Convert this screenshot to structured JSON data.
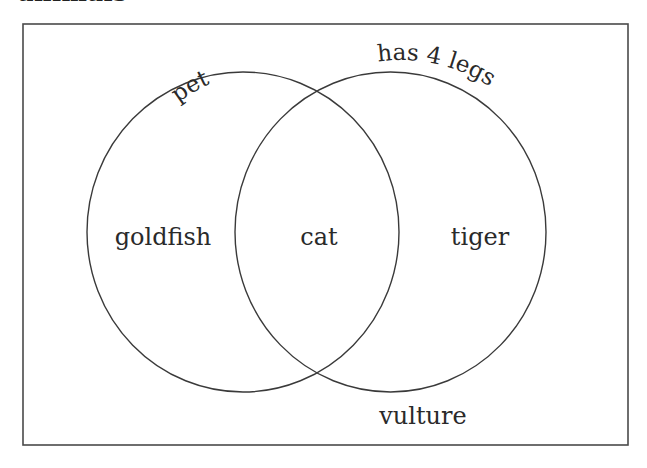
{
  "title": "animals",
  "diagram": {
    "type": "venn",
    "frame": {
      "x": 23,
      "y": 24,
      "width": 605,
      "height": 421,
      "stroke": "#4a4a4a"
    },
    "sets": [
      {
        "id": "pet",
        "label": "pet",
        "cx": 243,
        "cy": 232,
        "rx": 156,
        "ry": 160
      },
      {
        "id": "has4legs",
        "label": "has 4 legs",
        "cx": 390.5,
        "cy": 232,
        "rx": 155.5,
        "ry": 160
      }
    ],
    "regions": {
      "pet_only": "goldfish",
      "both": "cat",
      "has4legs_only": "tiger",
      "neither": "vulture"
    },
    "colors": {
      "stroke": "#3a3a3a",
      "text": "#2a2a2a",
      "background": "#ffffff"
    }
  }
}
